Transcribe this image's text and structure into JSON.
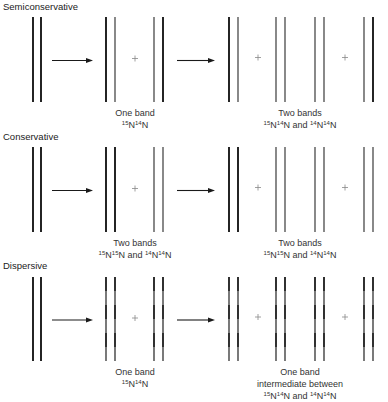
{
  "colors": {
    "old_strand": "#1a1a1a",
    "new_strand": "#6b6b6b",
    "arrow": "#1a1a1a",
    "plus": "#888888"
  },
  "rows": [
    {
      "title": "Semiconservative",
      "gen1_label": [
        "One band",
        "15N14N"
      ],
      "gen2_label": [
        "Two bands",
        "15N14N and 14N14N"
      ],
      "parent": [
        "old",
        "old"
      ],
      "gen1": [
        [
          "old",
          "new"
        ],
        [
          "new",
          "old"
        ]
      ],
      "gen2": [
        [
          "old",
          "new"
        ],
        [
          "new",
          "new"
        ],
        [
          "new",
          "new"
        ],
        [
          "new",
          "old"
        ]
      ]
    },
    {
      "title": "Conservative",
      "gen1_label": [
        "Two bands",
        "15N15N and 14N14N"
      ],
      "gen2_label": [
        "Two bands",
        "15N15N and 14N14N"
      ],
      "parent": [
        "old",
        "old"
      ],
      "gen1": [
        [
          "old",
          "old"
        ],
        [
          "new",
          "new"
        ]
      ],
      "gen2": [
        [
          "old",
          "old"
        ],
        [
          "new",
          "new"
        ],
        [
          "new",
          "new"
        ],
        [
          "new",
          "new"
        ]
      ]
    },
    {
      "title": "Dispersive",
      "gen1_label": [
        "One band",
        "15N14N"
      ],
      "gen2_label": [
        "One band",
        "intermediate between",
        "15N14N and 14N14N"
      ],
      "parent": [
        "old",
        "old"
      ],
      "gen1": [
        [
          "mixed",
          "mixed"
        ],
        [
          "mixed",
          "mixed"
        ]
      ],
      "gen2": [
        [
          "mixed",
          "mixed"
        ],
        [
          "mixed",
          "mixed"
        ],
        [
          "mixed",
          "mixed"
        ],
        [
          "mixed",
          "mixed"
        ]
      ]
    }
  ],
  "symbols": {
    "plus": "+"
  }
}
